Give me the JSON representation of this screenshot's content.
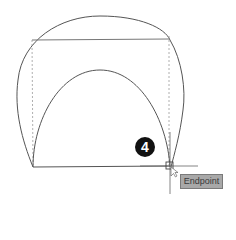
{
  "drawing": {
    "step_number": "4",
    "snap_tooltip": "Endpoint",
    "colors": {
      "line": "#555555",
      "dashed": "#9a9a9a",
      "tooltip_bg": "#a8a8a8",
      "badge_bg": "#111111"
    }
  }
}
